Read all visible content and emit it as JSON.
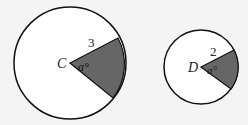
{
  "circles": [
    {
      "center_label": "C",
      "radius_label": "3",
      "angle_label": "a°",
      "fill": "#666666",
      "stroke": "#111111"
    },
    {
      "center_label": "D",
      "radius_label": "2",
      "angle_label": "a°",
      "fill": "#666666",
      "stroke": "#111111"
    }
  ]
}
